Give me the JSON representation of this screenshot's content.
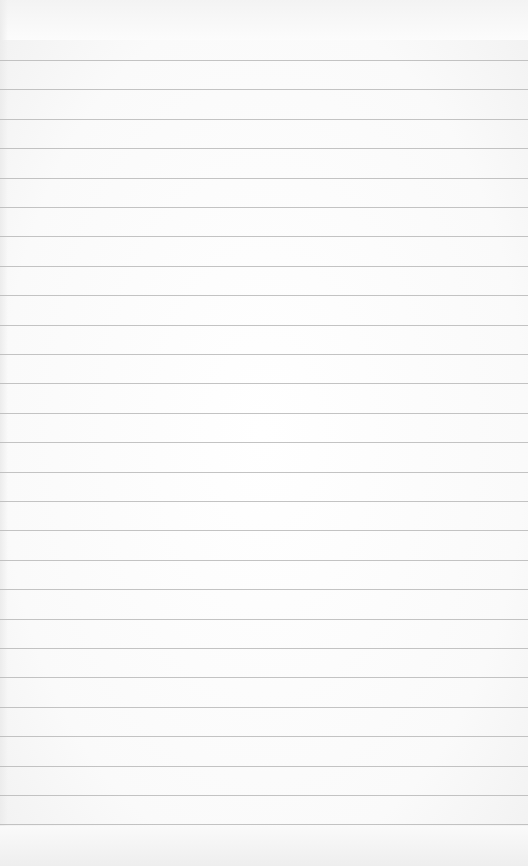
{
  "page": {
    "type": "lined-notepad-paper",
    "background_color": "#fbfbfb",
    "rule_color": "#b9b9b9",
    "rule_count": 27,
    "first_rule_y": 60,
    "rule_spacing": 29.4,
    "text_content": ""
  }
}
